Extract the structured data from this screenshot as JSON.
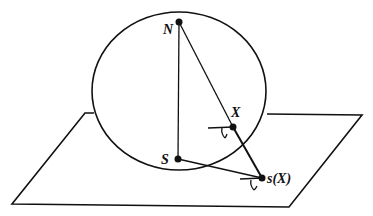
{
  "diagram": {
    "type": "stereographic-projection",
    "labels": {
      "north": "N",
      "south": "S",
      "point": "X",
      "projection": "s(X)"
    },
    "colors": {
      "stroke": "#111111",
      "background": "#ffffff"
    }
  }
}
